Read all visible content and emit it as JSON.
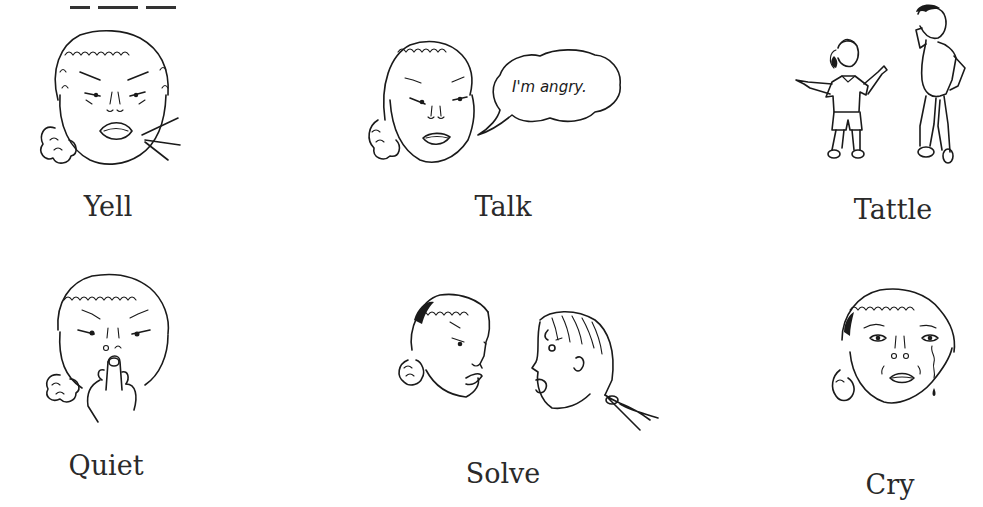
{
  "page": {
    "background": "#ffffff"
  },
  "choices": [
    {
      "id": "yell",
      "label": "Yell",
      "illustration": "angry-girl-yelling-face"
    },
    {
      "id": "talk",
      "label": "Talk",
      "illustration": "girl-face-with-speech-bubble",
      "speech_bubble": "I'm angry."
    },
    {
      "id": "tattle",
      "label": "Tattle",
      "illustration": "child-pointing-and-adult-listening"
    },
    {
      "id": "quiet",
      "label": "Quiet",
      "illustration": "girl-with-finger-on-lips"
    },
    {
      "id": "solve",
      "label": "Solve",
      "illustration": "two-girls-facing-each-other"
    },
    {
      "id": "cry",
      "label": "Cry",
      "illustration": "girl-crying-with-tear"
    }
  ]
}
